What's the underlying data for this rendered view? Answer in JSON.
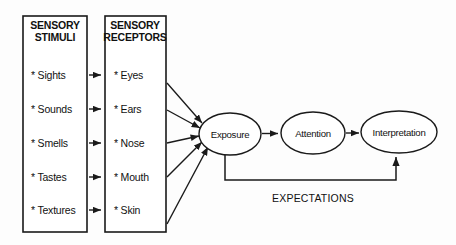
{
  "diagram": {
    "title_visible": false,
    "background_color": "#fdfdfd",
    "line_color": "#1a1a1a",
    "boxes": [
      {
        "id": "sensory-stimuli",
        "header_line1": "SENSORY",
        "header_line2": "STIMULI",
        "items": [
          "* Sights",
          "* Sounds",
          "* Smells",
          "* Tastes",
          "* Textures"
        ]
      },
      {
        "id": "sensory-receptors",
        "header_line1": "SENSORY",
        "header_line2": "RECEPTORS",
        "items": [
          "* Eyes",
          "* Ears",
          "* Nose",
          "* Mouth",
          "* Skin"
        ]
      }
    ],
    "nodes": [
      {
        "id": "exposure",
        "label": "Exposure"
      },
      {
        "id": "attention",
        "label": "Attention"
      },
      {
        "id": "interpretation",
        "label": "Interpretation"
      }
    ],
    "feedback": {
      "label": "EXPECTATIONS",
      "from": "exposure",
      "to": "interpretation"
    },
    "stimuli_to_receptors_arrow_count": 5,
    "receptors_to_exposure_arrow_count": 5
  }
}
